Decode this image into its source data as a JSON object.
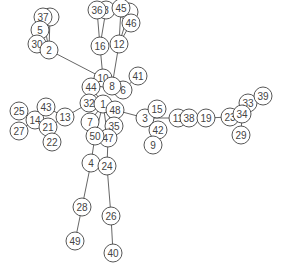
{
  "diagram": {
    "type": "network-graph",
    "node_radius": 9,
    "colors": {
      "stroke": "#444444",
      "fill": "#ffffff",
      "edge": "#555555",
      "background": "#ffffff"
    },
    "nodes": [
      {
        "id": "52",
        "label": "",
        "x": 129,
        "y": 12
      },
      {
        "id": "18",
        "label": "8",
        "x": 106,
        "y": 10
      },
      {
        "id": "53",
        "label": "",
        "x": 50,
        "y": 17
      },
      {
        "id": "36",
        "label": "36",
        "x": 97,
        "y": 10
      },
      {
        "id": "45",
        "label": "45",
        "x": 121,
        "y": 8
      },
      {
        "id": "46",
        "label": "46",
        "x": 131,
        "y": 23
      },
      {
        "id": "37",
        "label": "37",
        "x": 43,
        "y": 17
      },
      {
        "id": "5",
        "label": "5",
        "x": 40,
        "y": 30
      },
      {
        "id": "30",
        "label": "30",
        "x": 37,
        "y": 44
      },
      {
        "id": "2",
        "label": "2",
        "x": 49,
        "y": 50
      },
      {
        "id": "16",
        "label": "16",
        "x": 100,
        "y": 46
      },
      {
        "id": "12",
        "label": "12",
        "x": 119,
        "y": 44
      },
      {
        "id": "41",
        "label": "41",
        "x": 138,
        "y": 76
      },
      {
        "id": "6",
        "label": "6",
        "x": 123,
        "y": 90
      },
      {
        "id": "10",
        "label": "10",
        "x": 103,
        "y": 78
      },
      {
        "id": "8",
        "label": "8",
        "x": 112,
        "y": 86
      },
      {
        "id": "44",
        "label": "44",
        "x": 91,
        "y": 87
      },
      {
        "id": "32",
        "label": "32",
        "x": 89,
        "y": 103
      },
      {
        "id": "1",
        "label": "1",
        "x": 103,
        "y": 104
      },
      {
        "id": "48",
        "label": "48",
        "x": 115,
        "y": 110
      },
      {
        "id": "7",
        "label": "7",
        "x": 90,
        "y": 122
      },
      {
        "id": "35",
        "label": "35",
        "x": 114,
        "y": 126
      },
      {
        "id": "47",
        "label": "47",
        "x": 108,
        "y": 138
      },
      {
        "id": "50",
        "label": "50",
        "x": 95,
        "y": 136
      },
      {
        "id": "4",
        "label": "4",
        "x": 91,
        "y": 163
      },
      {
        "id": "24",
        "label": "24",
        "x": 107,
        "y": 166
      },
      {
        "id": "28",
        "label": "28",
        "x": 82,
        "y": 207
      },
      {
        "id": "26",
        "label": "26",
        "x": 111,
        "y": 216
      },
      {
        "id": "49",
        "label": "49",
        "x": 75,
        "y": 241
      },
      {
        "id": "40",
        "label": "40",
        "x": 113,
        "y": 253
      },
      {
        "id": "25",
        "label": "25",
        "x": 19,
        "y": 111
      },
      {
        "id": "27",
        "label": "27",
        "x": 19,
        "y": 131
      },
      {
        "id": "14",
        "label": "14",
        "x": 35,
        "y": 120
      },
      {
        "id": "43",
        "label": "43",
        "x": 46,
        "y": 107
      },
      {
        "id": "13",
        "label": "13",
        "x": 65,
        "y": 117
      },
      {
        "id": "21",
        "label": "21",
        "x": 48,
        "y": 127
      },
      {
        "id": "22",
        "label": "22",
        "x": 52,
        "y": 142
      },
      {
        "id": "3",
        "label": "3",
        "x": 145,
        "y": 118
      },
      {
        "id": "15",
        "label": "15",
        "x": 157,
        "y": 109
      },
      {
        "id": "42",
        "label": "42",
        "x": 158,
        "y": 130
      },
      {
        "id": "9",
        "label": "9",
        "x": 153,
        "y": 145
      },
      {
        "id": "11",
        "label": "11",
        "x": 178,
        "y": 118
      },
      {
        "id": "38",
        "label": "38",
        "x": 189,
        "y": 118
      },
      {
        "id": "19",
        "label": "19",
        "x": 206,
        "y": 118
      },
      {
        "id": "23",
        "label": "23",
        "x": 230,
        "y": 117
      },
      {
        "id": "33",
        "label": "33",
        "x": 248,
        "y": 103
      },
      {
        "id": "39",
        "label": "39",
        "x": 263,
        "y": 96
      },
      {
        "id": "34",
        "label": "34",
        "x": 242,
        "y": 114
      },
      {
        "id": "29",
        "label": "29",
        "x": 241,
        "y": 135
      }
    ],
    "edges": [
      [
        "37",
        "2"
      ],
      [
        "53",
        "2"
      ],
      [
        "5",
        "30"
      ],
      [
        "2",
        "10"
      ],
      [
        "36",
        "16"
      ],
      [
        "18",
        "16"
      ],
      [
        "45",
        "12"
      ],
      [
        "46",
        "12"
      ],
      [
        "52",
        "12"
      ],
      [
        "16",
        "10"
      ],
      [
        "12",
        "8"
      ],
      [
        "10",
        "44"
      ],
      [
        "10",
        "8"
      ],
      [
        "8",
        "6"
      ],
      [
        "6",
        "41"
      ],
      [
        "44",
        "1"
      ],
      [
        "1",
        "32"
      ],
      [
        "1",
        "48"
      ],
      [
        "1",
        "7"
      ],
      [
        "1",
        "35"
      ],
      [
        "1",
        "50"
      ],
      [
        "1",
        "47"
      ],
      [
        "32",
        "13"
      ],
      [
        "13",
        "43"
      ],
      [
        "13",
        "21"
      ],
      [
        "43",
        "14"
      ],
      [
        "14",
        "25"
      ],
      [
        "14",
        "27"
      ],
      [
        "14",
        "21"
      ],
      [
        "21",
        "22"
      ],
      [
        "48",
        "3"
      ],
      [
        "3",
        "15"
      ],
      [
        "3",
        "42"
      ],
      [
        "42",
        "9"
      ],
      [
        "3",
        "11"
      ],
      [
        "11",
        "38"
      ],
      [
        "38",
        "19"
      ],
      [
        "19",
        "23"
      ],
      [
        "23",
        "34"
      ],
      [
        "34",
        "33"
      ],
      [
        "33",
        "39"
      ],
      [
        "34",
        "29"
      ],
      [
        "50",
        "4"
      ],
      [
        "47",
        "24"
      ],
      [
        "4",
        "28"
      ],
      [
        "28",
        "49"
      ],
      [
        "24",
        "26"
      ],
      [
        "26",
        "40"
      ]
    ]
  }
}
